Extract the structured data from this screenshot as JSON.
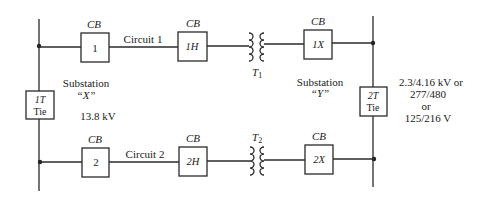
{
  "diagram": {
    "type": "one-line electrical distribution diagram",
    "substations": [
      {
        "id": "X",
        "label": "Substation",
        "name": "“X”",
        "voltage": "13.8 kV"
      },
      {
        "id": "Y",
        "label": "Substation",
        "name": "“Y”",
        "voltage_lines": [
          "2.3/4.16 kV or",
          "277/480",
          "or",
          "125/216 V"
        ]
      }
    ],
    "circuits": [
      {
        "label": "Circuit 1",
        "source_cb": "1",
        "high_cb": "1H",
        "transformer": "T1",
        "low_cb": "1X"
      },
      {
        "label": "Circuit 2",
        "source_cb": "2",
        "high_cb": "2H",
        "transformer": "T2",
        "low_cb": "2X"
      }
    ],
    "breaker_label": "CB",
    "ties": [
      {
        "id": "1T",
        "top": "1T",
        "bottom": "Tie"
      },
      {
        "id": "2T",
        "top": "2T",
        "bottom": "Tie"
      }
    ],
    "transformers": [
      {
        "main": "T",
        "sub": "1"
      },
      {
        "main": "T",
        "sub": "2"
      }
    ]
  }
}
